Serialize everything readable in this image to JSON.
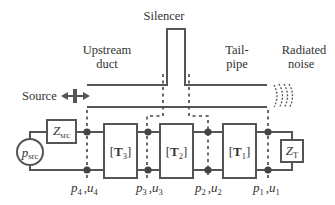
{
  "diagram": {
    "labels": {
      "silencer": "Silencer",
      "upstream_line1": "Upstream",
      "upstream_line2": "duct",
      "tailpipe_line1": "Tail-",
      "tailpipe_line2": "pipe",
      "radiated_line1": "Radiated",
      "radiated_line2": "noise",
      "source": "Source"
    },
    "circuit": {
      "source_symbol": "p",
      "source_sub": "src",
      "source_impedance_symbol": "Z",
      "source_impedance_sub": "src",
      "termination_symbol": "Z",
      "termination_sub": "T",
      "transfer_matrices": [
        {
          "bracket_open": "[",
          "symbol": "T",
          "sub": "3",
          "bracket_close": "]"
        },
        {
          "bracket_open": "[",
          "symbol": "T",
          "sub": "2",
          "bracket_close": "]"
        },
        {
          "bracket_open": "[",
          "symbol": "T",
          "sub": "1",
          "bracket_close": "]"
        }
      ],
      "nodes": [
        {
          "p": "p",
          "p_sub": "4",
          "sep": ",",
          "u": "u",
          "u_sub": "4"
        },
        {
          "p": "p",
          "p_sub": "3",
          "sep": ",",
          "u": "u",
          "u_sub": "3"
        },
        {
          "p": "p",
          "p_sub": "2",
          "sep": ",",
          "u": "u",
          "u_sub": "2"
        },
        {
          "p": "p",
          "p_sub": "1",
          "sep": ",",
          "u": "u",
          "u_sub": "1"
        }
      ]
    },
    "colors": {
      "line": "#555555",
      "text": "#333333",
      "dashed": "#444444"
    }
  }
}
